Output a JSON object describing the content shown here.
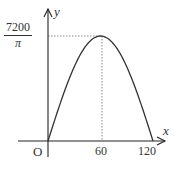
{
  "chart_data": {
    "type": "line",
    "title": "",
    "xlabel": "x",
    "ylabel": "y",
    "origin_label": "O",
    "x_ticks": [
      "60",
      "120"
    ],
    "y_ticks": [
      {
        "numerator": "7200",
        "denominator": "π"
      }
    ],
    "xlim": [
      0,
      120
    ],
    "ylim": [
      0,
      2291.8
    ],
    "grid": false,
    "series": [
      {
        "name": "y = (7200/π)·sin(πx/120)",
        "x": [
          0,
          15,
          30,
          45,
          60,
          75,
          90,
          105,
          120
        ],
        "y": [
          0,
          877.1,
          1620.5,
          2117.3,
          2291.8,
          2117.3,
          1620.5,
          877.1,
          0
        ]
      }
    ],
    "annotations": [
      {
        "type": "dashed-line",
        "from": [
          0,
          2291.8
        ],
        "to": [
          60,
          2291.8
        ]
      },
      {
        "type": "dashed-line",
        "from": [
          60,
          0
        ],
        "to": [
          60,
          2291.8
        ]
      }
    ],
    "colors": {
      "curve": "#333333",
      "axes": "#222222",
      "guides": "#888888"
    }
  }
}
